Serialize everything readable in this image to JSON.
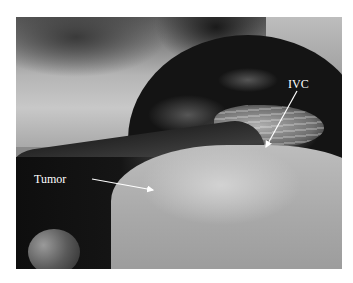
{
  "figure": {
    "type": "grayscale surgical photograph",
    "background_color": "#ffffff",
    "annotations": [
      {
        "label": "IVC",
        "arrow_color": "#ffffff",
        "text_color": "#ffffff"
      },
      {
        "label": "Tumor",
        "arrow_color": "#ffffff",
        "text_color": "#ffffff"
      }
    ]
  }
}
